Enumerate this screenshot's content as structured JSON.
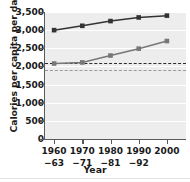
{
  "chart_data": {
    "type": "line",
    "title": "",
    "xlabel": "Year",
    "ylabel": "Calories per capita per day",
    "ylim": [
      0,
      3500
    ],
    "grid": true,
    "legend": "none",
    "categories": [
      "1960–63",
      "1970–71",
      "1980–81",
      "1990–92",
      "2000"
    ],
    "x_tick_lines": [
      {
        "line1": "1960",
        "line2": "−63"
      },
      {
        "line1": "1970",
        "line2": "−71"
      },
      {
        "line1": "1980",
        "line2": "−81"
      },
      {
        "line1": "1990",
        "line2": "−92"
      },
      {
        "line1": "2000",
        "line2": ""
      }
    ],
    "y_ticks": [
      0,
      500,
      1000,
      1500,
      2000,
      2500,
      3000,
      3500
    ],
    "y_tick_labels": [
      "0",
      "500",
      "1,000",
      "1,500",
      "2,000",
      "2,500",
      "3,000",
      "3,500"
    ],
    "series": [
      {
        "name": "upper-series",
        "marker": "square",
        "color": "#333333",
        "values": [
          3000,
          3120,
          3250,
          3350,
          3400
        ]
      },
      {
        "name": "lower-series",
        "marker": "square",
        "color": "#777777",
        "values": [
          2080,
          2110,
          2300,
          2490,
          2700
        ]
      }
    ],
    "reference_lines": [
      {
        "name": "upper-dashed-reference",
        "value": 2100,
        "style": "dashed",
        "color": "#2b2b2b"
      },
      {
        "name": "lower-dashed-reference",
        "value": 1900,
        "style": "dashed",
        "color": "#9a9a9a"
      }
    ],
    "colors": {
      "plot_background": "#ededed",
      "gridline": "#ffffff",
      "axis": "#5a5a5a",
      "text": "#1a1a1a"
    }
  }
}
